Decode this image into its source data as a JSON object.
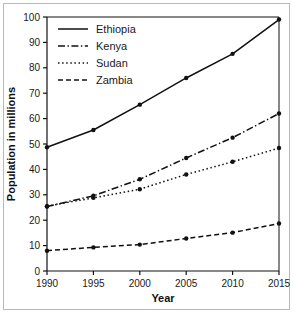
{
  "chart_data": {
    "type": "line",
    "title": "",
    "xlabel": "Year",
    "ylabel": "Population in millions",
    "categories": [
      1990,
      1995,
      2000,
      2005,
      2010,
      2015
    ],
    "x_tick_labels": [
      "1990",
      "1995",
      "2000",
      "2005",
      "2010",
      "2015"
    ],
    "y_tick_labels": [
      "0",
      "10",
      "20",
      "30",
      "40",
      "50",
      "60",
      "70",
      "80",
      "90",
      "100"
    ],
    "y_ticks": [
      0,
      10,
      20,
      30,
      40,
      50,
      60,
      70,
      80,
      90,
      100
    ],
    "xlim": [
      1990,
      2015
    ],
    "ylim": [
      0,
      100
    ],
    "grid": false,
    "legend_position": "top-left",
    "marker": "circle",
    "line_color": "#111111",
    "series": [
      {
        "name": "Ethiopia",
        "style": "solid",
        "values": [
          48.7,
          55.5,
          65.5,
          76.0,
          85.5,
          99.0
        ]
      },
      {
        "name": "Kenya",
        "style": "dash-dot",
        "values": [
          25.4,
          29.6,
          36.1,
          44.5,
          52.5,
          62.0
        ]
      },
      {
        "name": "Sudan",
        "style": "dotted",
        "values": [
          25.5,
          28.8,
          32.2,
          38.0,
          43.0,
          48.4
        ]
      },
      {
        "name": "Zambia",
        "style": "dashed",
        "values": [
          8.0,
          9.3,
          10.4,
          12.8,
          15.1,
          18.7
        ]
      }
    ]
  },
  "legend": {
    "items": [
      {
        "label": "Ethiopia"
      },
      {
        "label": "Kenya"
      },
      {
        "label": "Sudan"
      },
      {
        "label": "Zambia"
      }
    ]
  },
  "axes": {
    "x_axis_title": "Year",
    "y_axis_title": "Population in millions"
  },
  "colors": {
    "ink": "#111111",
    "frame": "#b9b9b9",
    "background": "#ffffff"
  }
}
